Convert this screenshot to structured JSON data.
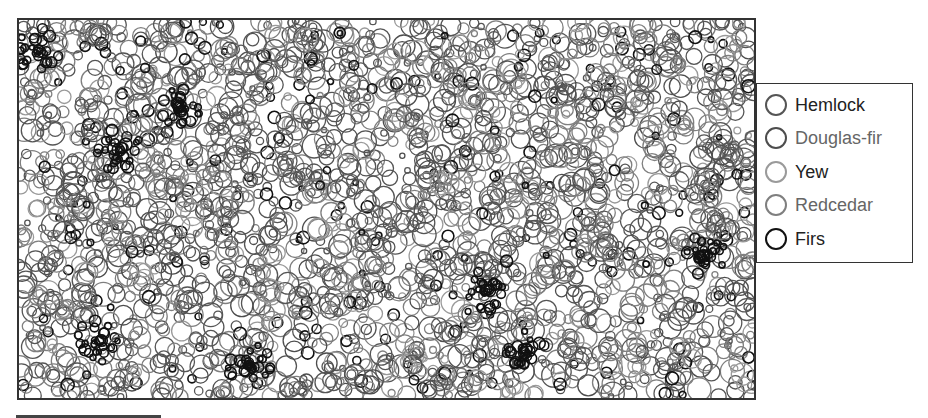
{
  "chart_data": {
    "type": "scatter",
    "subtype": "stem-map (circles sized by tree diameter)",
    "title": "",
    "xlabel": "",
    "ylabel": "",
    "axes_visible": false,
    "grid": false,
    "legend_position": "right",
    "series": [
      {
        "name": "Hemlock",
        "color": "#555555",
        "label_color": "#222222",
        "share": 0.4
      },
      {
        "name": "Douglas-fir",
        "color": "#4d4d4d",
        "label_color": "#666666",
        "share": 0.1
      },
      {
        "name": "Yew",
        "color": "#9a9a9a",
        "label_color": "#222222",
        "share": 0.12
      },
      {
        "name": "Redcedar",
        "color": "#7f7f7f",
        "label_color": "#666666",
        "share": 0.3
      },
      {
        "name": "Firs",
        "color": "#111111",
        "label_color": "#222222",
        "share": 0.08
      }
    ],
    "generation": {
      "seed": 20240607,
      "count": 2600,
      "radius_min": 2.5,
      "radius_max": 12,
      "plot_width": 735,
      "plot_height": 378,
      "firs_clusters": [
        [
          20,
          30
        ],
        [
          100,
          130
        ],
        [
          160,
          85
        ],
        [
          470,
          270
        ],
        [
          505,
          330
        ],
        [
          685,
          235
        ],
        [
          230,
          345
        ],
        [
          80,
          320
        ]
      ]
    },
    "sample_points": [
      {
        "species": "Firs",
        "x": 18,
        "y": 28,
        "r": 4
      },
      {
        "species": "Firs",
        "x": 25,
        "y": 35,
        "r": 3
      },
      {
        "species": "Hemlock",
        "x": 180,
        "y": 110,
        "r": 10
      },
      {
        "species": "Redcedar",
        "x": 360,
        "y": 180,
        "r": 11
      },
      {
        "species": "Yew",
        "x": 190,
        "y": 145,
        "r": 8
      },
      {
        "species": "Firs",
        "x": 470,
        "y": 285,
        "r": 5
      },
      {
        "species": "Firs",
        "x": 682,
        "y": 240,
        "r": 6
      },
      {
        "species": "Douglas-fir",
        "x": 530,
        "y": 320,
        "r": 12
      }
    ]
  },
  "legend": {
    "items": [
      {
        "label": "Hemlock"
      },
      {
        "label": "Douglas-fir"
      },
      {
        "label": "Yew"
      },
      {
        "label": "Redcedar"
      },
      {
        "label": "Firs"
      }
    ]
  },
  "scale_bar": {
    "length_px": 145
  }
}
